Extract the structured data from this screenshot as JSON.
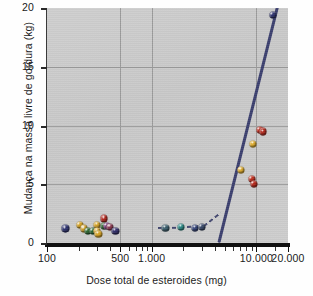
{
  "chart_data": {
    "type": "scatter",
    "title": "",
    "xlabel": "Dose total de esteroides (mg)",
    "ylabel": "Mudança na massa livre de gordura (kg)",
    "xscale": "log",
    "xlim": [
      100,
      20000
    ],
    "ylim": [
      0,
      20
    ],
    "xticks": [
      {
        "value": 100,
        "label": "100",
        "major": true
      },
      {
        "value": 200,
        "label": "",
        "major": false
      },
      {
        "value": 300,
        "label": "",
        "major": false
      },
      {
        "value": 400,
        "label": "",
        "major": false
      },
      {
        "value": 500,
        "label": "500",
        "major": true
      },
      {
        "value": 600,
        "label": "",
        "major": false
      },
      {
        "value": 700,
        "label": "",
        "major": false
      },
      {
        "value": 800,
        "label": "",
        "major": false
      },
      {
        "value": 900,
        "label": "",
        "major": false
      },
      {
        "value": 1000,
        "label": "1.000",
        "major": true
      },
      {
        "value": 2000,
        "label": "",
        "major": false
      },
      {
        "value": 3000,
        "label": "",
        "major": false
      },
      {
        "value": 4000,
        "label": "",
        "major": false
      },
      {
        "value": 5000,
        "label": "",
        "major": false
      },
      {
        "value": 6000,
        "label": "",
        "major": false
      },
      {
        "value": 7000,
        "label": "",
        "major": false
      },
      {
        "value": 8000,
        "label": "",
        "major": false
      },
      {
        "value": 9000,
        "label": "",
        "major": false
      },
      {
        "value": 10000,
        "label": "10.000",
        "major": true
      },
      {
        "value": 15000,
        "label": "",
        "major": false
      },
      {
        "value": 20000,
        "label": "20.000",
        "major": true
      }
    ],
    "yticks": [
      0,
      5,
      10,
      15,
      20
    ],
    "gridlines": {
      "x": [
        500,
        1000,
        10000
      ],
      "y": [
        5,
        10,
        15
      ],
      "visible": true
    },
    "points": [
      {
        "x": 150,
        "y": 1.25,
        "color": "#2f3470"
      },
      {
        "x": 205,
        "y": 1.55,
        "color": "#d8a526"
      },
      {
        "x": 225,
        "y": 1.25,
        "color": "#cfa02a"
      },
      {
        "x": 245,
        "y": 1.05,
        "color": "#2f6b33"
      },
      {
        "x": 272,
        "y": 1.05,
        "color": "#2c6a36"
      },
      {
        "x": 300,
        "y": 1.55,
        "color": "#d9a72b"
      },
      {
        "x": 300,
        "y": 1.0,
        "color": "#e0ad2e"
      },
      {
        "x": 310,
        "y": 0.8,
        "color": "#d8a526"
      },
      {
        "x": 350,
        "y": 2.1,
        "color": "#b2281f"
      },
      {
        "x": 352,
        "y": 1.45,
        "color": "#2f6b33"
      },
      {
        "x": 372,
        "y": 1.45,
        "color": "#7a3a7e"
      },
      {
        "x": 398,
        "y": 1.35,
        "color": "#8d3a52"
      },
      {
        "x": 450,
        "y": 1.05,
        "color": "#33306c"
      },
      {
        "x": 1350,
        "y": 1.3,
        "color": "#3c5f6e"
      },
      {
        "x": 1900,
        "y": 1.35,
        "color": "#2e8c88"
      },
      {
        "x": 2600,
        "y": 1.3,
        "color": "#35457a"
      },
      {
        "x": 3000,
        "y": 1.35,
        "color": "#3a4a6b"
      },
      {
        "x": 7100,
        "y": 6.2,
        "color": "#e0ad2e"
      },
      {
        "x": 9000,
        "y": 5.45,
        "color": "#c03020"
      },
      {
        "x": 9400,
        "y": 5.05,
        "color": "#b8291c"
      },
      {
        "x": 9300,
        "y": 8.45,
        "color": "#e3b02f"
      },
      {
        "x": 10700,
        "y": 9.6,
        "color": "#c02a1c"
      },
      {
        "x": 11600,
        "y": 9.5,
        "color": "#b42a1e"
      },
      {
        "x": 14300,
        "y": 19.4,
        "color": "#2f3470"
      }
    ],
    "fit_line": {
      "style": "solid",
      "color": "#3b3f6e",
      "from": {
        "x": 4400,
        "y": 0.0
      },
      "to": {
        "x": 16500,
        "y": 20.6
      }
    },
    "dashed_segments": [
      {
        "from": {
          "x": 1150,
          "y": 1.3
        },
        "to": {
          "x": 2000,
          "y": 1.32
        }
      },
      {
        "from": {
          "x": 2150,
          "y": 1.35
        },
        "to": {
          "x": 3150,
          "y": 1.45
        }
      },
      {
        "from": {
          "x": 3150,
          "y": 1.45
        },
        "to": {
          "x": 4500,
          "y": 2.55
        }
      }
    ]
  }
}
